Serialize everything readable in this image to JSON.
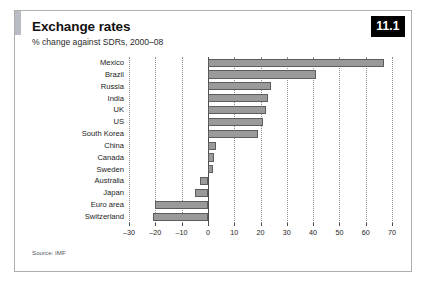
{
  "figure": {
    "badge": "11.1",
    "title": "Exchange rates",
    "subtitle": "% change against SDRs, 2000–08",
    "source": "Source: IMF"
  },
  "chart_data": {
    "type": "bar",
    "orientation": "horizontal",
    "title": "Exchange rates",
    "subtitle": "% change against SDRs, 2000–08",
    "xlabel": "",
    "ylabel": "",
    "xlim": [
      -30,
      70
    ],
    "xticks": [
      -30,
      -20,
      -10,
      0,
      10,
      20,
      30,
      40,
      50,
      60,
      70
    ],
    "xtick_labels": [
      "–30",
      "–20",
      "–10",
      "0",
      "10",
      "20",
      "30",
      "40",
      "50",
      "60",
      "70"
    ],
    "grid": true,
    "legend": false,
    "source": "Source: IMF",
    "bar_color": "#9a9a9a",
    "bar_edge_color": "#5d5d5d",
    "categories": [
      "Mexico",
      "Brazil",
      "Russia",
      "India",
      "UK",
      "US",
      "South Korea",
      "China",
      "Canada",
      "Sweden",
      "Australia",
      "Japan",
      "Euro area",
      "Switzerland"
    ],
    "values": [
      67,
      41,
      24,
      23,
      22,
      21,
      19,
      3,
      2.5,
      2,
      -3,
      -5,
      -20,
      -21
    ]
  }
}
